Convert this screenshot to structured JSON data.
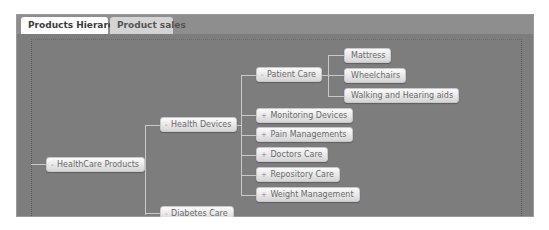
{
  "tabs": [
    {
      "label": "Products Hierarchy",
      "active": true
    },
    {
      "label": "Product sales",
      "active": false
    }
  ],
  "tree": {
    "root": {
      "toggle": "-",
      "label": "HealthCare Products"
    },
    "level1": [
      {
        "toggle": "-",
        "label": "Health Devices"
      },
      {
        "toggle": "-",
        "label": "Diabetes Care"
      }
    ],
    "level2": [
      {
        "toggle": "-",
        "label": "Patient Care"
      },
      {
        "toggle": "+",
        "label": "Monitoring Devices"
      },
      {
        "toggle": "+",
        "label": "Pain Managements"
      },
      {
        "toggle": "+",
        "label": "Doctors Care"
      },
      {
        "toggle": "+",
        "label": "Repository Care"
      },
      {
        "toggle": "+",
        "label": "Weight Management"
      }
    ],
    "level3": [
      {
        "label": "Mattress"
      },
      {
        "label": "Wheelchairs"
      },
      {
        "label": "Walking and Hearing aids"
      }
    ]
  }
}
